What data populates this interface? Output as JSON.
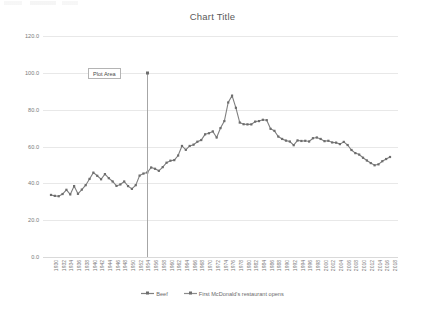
{
  "chart_data": {
    "type": "line",
    "title": "Chart Title",
    "xlabel": "",
    "ylabel": "",
    "ylim": [
      0.0,
      120.0
    ],
    "ytick_labels": [
      "0.0",
      "20.0",
      "40.0",
      "60.0",
      "80.0",
      "100.0",
      "120.0"
    ],
    "ytick_values": [
      0.0,
      20.0,
      40.0,
      60.0,
      80.0,
      100.0,
      120.0
    ],
    "grid": true,
    "legend_position": "bottom",
    "annotations": [
      {
        "text": "Plot Area",
        "kind": "tooltip-box"
      }
    ],
    "x": [
      1930,
      1931,
      1932,
      1933,
      1934,
      1935,
      1936,
      1937,
      1938,
      1939,
      1940,
      1941,
      1942,
      1943,
      1944,
      1945,
      1946,
      1947,
      1948,
      1949,
      1950,
      1951,
      1952,
      1953,
      1954,
      1955,
      1956,
      1957,
      1958,
      1959,
      1960,
      1961,
      1962,
      1963,
      1964,
      1965,
      1966,
      1967,
      1968,
      1969,
      1970,
      1971,
      1972,
      1973,
      1974,
      1975,
      1976,
      1977,
      1978,
      1979,
      1980,
      1981,
      1982,
      1983,
      1984,
      1985,
      1986,
      1987,
      1988,
      1989,
      1990,
      1991,
      1992,
      1993,
      1994,
      1995,
      1996,
      1997,
      1998,
      1999,
      2000,
      2001,
      2002,
      2003,
      2004,
      2005,
      2006,
      2007,
      2008,
      2009,
      2010,
      2011,
      2012,
      2013,
      2014,
      2015,
      2016,
      2017,
      2018
    ],
    "xtick_labels": [
      "1930",
      "1932",
      "1934",
      "1936",
      "1938",
      "1940",
      "1942",
      "1944",
      "1946",
      "1948",
      "1950",
      "1952",
      "1954",
      "1956",
      "1958",
      "1960",
      "1962",
      "1964",
      "1966",
      "1968",
      "1970",
      "1972",
      "1974",
      "1976",
      "1978",
      "1980",
      "1982",
      "1984",
      "1986",
      "1988",
      "1990",
      "1992",
      "1994",
      "1996",
      "1998",
      "2000",
      "2002",
      "2004",
      "2006",
      "2008",
      "2010",
      "2012",
      "2014",
      "2016",
      "2018"
    ],
    "xtick_step": 2,
    "series": [
      {
        "name": "Beef",
        "color": "#7f7f7f",
        "values": [
          33.7,
          33.2,
          33.0,
          34.2,
          36.5,
          34.0,
          38.5,
          34.3,
          36.6,
          39.0,
          42.4,
          45.8,
          44.1,
          42.2,
          45.0,
          42.8,
          41.0,
          38.6,
          39.4,
          41.0,
          38.5,
          37.0,
          39.0,
          44.2,
          45.3,
          45.9,
          48.6,
          47.9,
          46.8,
          48.8,
          51.2,
          52.3,
          52.6,
          55.1,
          60.3,
          58.2,
          60.3,
          61.0,
          62.6,
          63.5,
          66.6,
          67.2,
          68.2,
          64.9,
          70.0,
          73.8,
          83.9,
          87.6,
          81.0,
          73.0,
          72.1,
          72.0,
          72.0,
          73.5,
          73.8,
          74.5,
          74.3,
          69.6,
          68.5,
          65.4,
          64.1,
          63.2,
          62.7,
          60.7,
          63.3,
          63.0,
          63.1,
          62.7,
          64.5,
          64.9,
          64.1,
          62.9,
          63.1,
          62.2,
          62.1,
          61.3,
          62.5,
          60.8,
          58.1,
          56.4,
          55.6,
          53.9,
          52.4,
          51.0,
          49.8,
          50.3,
          52.0,
          53.2,
          54.3
        ]
      },
      {
        "name": "First McDonald's restaurant opens",
        "color": "#8c8c8c",
        "marker_year": 1955,
        "marker_value": 100.0
      }
    ]
  },
  "legend": {
    "items": [
      {
        "label": "Beef",
        "color": "#7f7f7f"
      },
      {
        "label": "First McDonald's restaurant opens",
        "color": "#8c8c8c"
      }
    ]
  }
}
